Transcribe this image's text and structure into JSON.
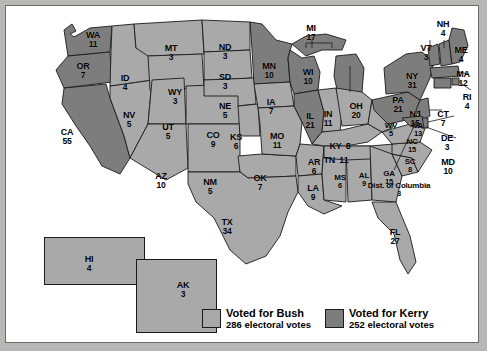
{
  "map": {
    "title": "2004 United States presidential election electoral vote map",
    "colors": {
      "bush": "#a9a9a9",
      "kerry": "#7d7d7d",
      "outline": "#1a1a1a",
      "frame": "#b9b7b5",
      "canvas": "#ffffff"
    }
  },
  "legend": {
    "bush": {
      "label": "Voted for Bush",
      "votes": "286 electoral votes",
      "color": "#a9a9a9"
    },
    "kerry": {
      "label": "Voted for Kerry",
      "votes": "252 electoral votes",
      "color": "#7d7d7d"
    }
  },
  "states": {
    "WA": {
      "abbr": "WA",
      "ev": "11"
    },
    "OR": {
      "abbr": "OR",
      "ev": "7"
    },
    "CA": {
      "abbr": "CA",
      "ev": "55"
    },
    "NV": {
      "abbr": "NV",
      "ev": "5"
    },
    "ID": {
      "abbr": "ID",
      "ev": "4"
    },
    "MT": {
      "abbr": "MT",
      "ev": "3"
    },
    "WY": {
      "abbr": "WY",
      "ev": "3"
    },
    "UT": {
      "abbr": "UT",
      "ev": "5"
    },
    "AZ": {
      "abbr": "AZ",
      "ev": "10"
    },
    "NM": {
      "abbr": "NM",
      "ev": "5"
    },
    "CO": {
      "abbr": "CO",
      "ev": "9"
    },
    "ND": {
      "abbr": "ND",
      "ev": "3"
    },
    "SD": {
      "abbr": "SD",
      "ev": "3"
    },
    "NE": {
      "abbr": "NE",
      "ev": "5"
    },
    "KS": {
      "abbr": "KS",
      "ev": "6"
    },
    "OK": {
      "abbr": "OK",
      "ev": "7"
    },
    "TX": {
      "abbr": "TX",
      "ev": "34"
    },
    "MN": {
      "abbr": "MN",
      "ev": "10"
    },
    "IA": {
      "abbr": "IA",
      "ev": "7"
    },
    "MO": {
      "abbr": "MO",
      "ev": "11"
    },
    "AR": {
      "abbr": "AR",
      "ev": "6"
    },
    "LA": {
      "abbr": "LA",
      "ev": "9"
    },
    "WI": {
      "abbr": "WI",
      "ev": "10"
    },
    "IL": {
      "abbr": "IL",
      "ev": "21"
    },
    "MS": {
      "abbr": "MS",
      "ev": "6"
    },
    "AL": {
      "abbr": "AL",
      "ev": "9"
    },
    "MI": {
      "abbr": "MI",
      "ev": "17"
    },
    "IN": {
      "abbr": "IN",
      "ev": "11"
    },
    "OH": {
      "abbr": "OH",
      "ev": "20"
    },
    "KY": {
      "abbr": "KY",
      "ev": "8"
    },
    "TN": {
      "abbr": "TN",
      "ev": "11"
    },
    "GA": {
      "abbr": "GA",
      "ev": "15"
    },
    "FL": {
      "abbr": "FL",
      "ev": "27"
    },
    "SC": {
      "abbr": "SC",
      "ev": "8"
    },
    "NC": {
      "abbr": "NC",
      "ev": "15"
    },
    "VA": {
      "abbr": "VA",
      "ev": "13"
    },
    "WV": {
      "abbr": "WV",
      "ev": "5"
    },
    "PA": {
      "abbr": "PA",
      "ev": "21"
    },
    "NY": {
      "abbr": "NY",
      "ev": "31"
    },
    "VT": {
      "abbr": "VT",
      "ev": "3"
    },
    "NH": {
      "abbr": "NH",
      "ev": "4"
    },
    "ME": {
      "abbr": "ME",
      "ev": "4"
    },
    "MA": {
      "abbr": "MA",
      "ev": "12"
    },
    "RI": {
      "abbr": "RI",
      "ev": "4"
    },
    "CT": {
      "abbr": "CT",
      "ev": "7"
    },
    "NJ": {
      "abbr": "NJ",
      "ev": "15"
    },
    "DE": {
      "abbr": "DE",
      "ev": "3"
    },
    "MD": {
      "abbr": "MD",
      "ev": "10"
    },
    "DC": {
      "abbr": "Dist. of Columbia",
      "ev": "3"
    },
    "AK": {
      "abbr": "AK",
      "ev": "3"
    },
    "HI": {
      "abbr": "HI",
      "ev": "4"
    }
  }
}
